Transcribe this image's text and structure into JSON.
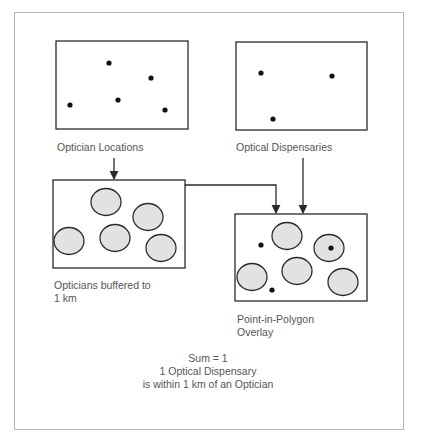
{
  "diagram": {
    "panels": {
      "optician_locations": {
        "label": "Optician Locations",
        "points": [
          [
            109,
            63
          ],
          [
            151,
            78
          ],
          [
            70,
            105
          ],
          [
            118,
            100
          ],
          [
            165,
            110
          ]
        ]
      },
      "optical_dispensaries": {
        "label": "Optical Dispensaries",
        "points": [
          [
            261,
            73
          ],
          [
            332,
            76
          ],
          [
            273,
            119
          ]
        ]
      },
      "buffered": {
        "label_line1": "Opticians buffered to",
        "label_line2": "1 km",
        "buffers": [
          [
            106,
            202
          ],
          [
            148,
            217
          ],
          [
            69,
            241
          ],
          [
            115,
            238
          ],
          [
            161,
            248
          ]
        ]
      },
      "overlay": {
        "label_line1": "Point-in-Polygon",
        "label_line2": "Overlay",
        "buffers": [
          [
            287,
            236
          ],
          [
            329,
            248
          ],
          [
            252,
            277
          ],
          [
            297,
            271
          ],
          [
            343,
            282
          ]
        ],
        "points": [
          [
            261,
            245
          ],
          [
            331,
            248
          ],
          [
            272,
            290
          ]
        ]
      }
    },
    "result": {
      "line1": "Sum = 1",
      "line2": "1 Optical Dispensary",
      "line3": "is within 1 km of an Optician"
    },
    "colors": {
      "stroke": "#2a2a2a",
      "buffer_fill": "#e2e2e2",
      "frame": "#b4b4b4",
      "text": "#555555"
    }
  }
}
